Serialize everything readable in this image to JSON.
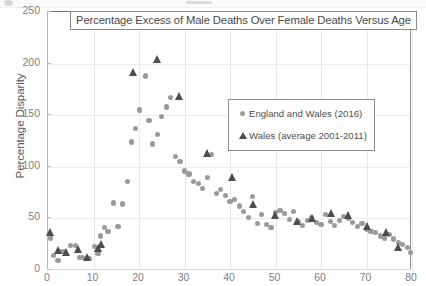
{
  "chart_data": {
    "type": "scatter",
    "title": "Percentage Excess of Male Deaths Over Female Deaths Versus Age",
    "xlabel": "Age",
    "ylabel": "Percentage Disparity",
    "xlim": [
      0,
      80
    ],
    "ylim": [
      0,
      250
    ],
    "xticks": [
      0,
      10,
      20,
      30,
      40,
      50,
      60,
      70,
      80
    ],
    "yticks": [
      0,
      50,
      100,
      150,
      200,
      250
    ],
    "grid": true,
    "legend_position": "center-right",
    "series": [
      {
        "name": "England and Wales (2016)",
        "marker": "circle",
        "color": "#9a9a9a",
        "points": [
          [
            0.5,
            31
          ],
          [
            1.2,
            14
          ],
          [
            2.2,
            9
          ],
          [
            3.0,
            18
          ],
          [
            3.6,
            18
          ],
          [
            5.0,
            24
          ],
          [
            6.0,
            24
          ],
          [
            7.0,
            12
          ],
          [
            7.6,
            12
          ],
          [
            9.0,
            11
          ],
          [
            10.2,
            23
          ],
          [
            11.0,
            16
          ],
          [
            11.6,
            33
          ],
          [
            12.4,
            41
          ],
          [
            13.2,
            37
          ],
          [
            14.4,
            65
          ],
          [
            15.4,
            42
          ],
          [
            16.4,
            64
          ],
          [
            17.4,
            86
          ],
          [
            18.4,
            124
          ],
          [
            19.2,
            137
          ],
          [
            20.2,
            155
          ],
          [
            21.4,
            188
          ],
          [
            22.2,
            145
          ],
          [
            23.0,
            122
          ],
          [
            24.0,
            131
          ],
          [
            25.0,
            149
          ],
          [
            26.0,
            158
          ],
          [
            27.0,
            167
          ],
          [
            28.0,
            110
          ],
          [
            29.0,
            105
          ],
          [
            30.0,
            96
          ],
          [
            31.0,
            93
          ],
          [
            32.0,
            86
          ],
          [
            33.0,
            84
          ],
          [
            34.0,
            79
          ],
          [
            35.0,
            90
          ],
          [
            36.0,
            112
          ],
          [
            37.0,
            74
          ],
          [
            38.0,
            78
          ],
          [
            39.0,
            72
          ],
          [
            40.0,
            66
          ],
          [
            41.0,
            68
          ],
          [
            42.0,
            62
          ],
          [
            43.0,
            57
          ],
          [
            44.0,
            51
          ],
          [
            45.0,
            71
          ],
          [
            46.0,
            45
          ],
          [
            47.0,
            54
          ],
          [
            48.0,
            44
          ],
          [
            49.0,
            41
          ],
          [
            50.0,
            56
          ],
          [
            51.0,
            58
          ],
          [
            52.0,
            55
          ],
          [
            53.0,
            49
          ],
          [
            54.0,
            57
          ],
          [
            55.0,
            47
          ],
          [
            56.0,
            43
          ],
          [
            57.0,
            48
          ],
          [
            58.0,
            51
          ],
          [
            59.0,
            46
          ],
          [
            60.0,
            44
          ],
          [
            61.0,
            54
          ],
          [
            62.0,
            47
          ],
          [
            63.0,
            43
          ],
          [
            64.0,
            48
          ],
          [
            65.0,
            52
          ],
          [
            66.0,
            50
          ],
          [
            67.0,
            46
          ],
          [
            68.0,
            42
          ],
          [
            69.0,
            45
          ],
          [
            70.0,
            39
          ],
          [
            71.0,
            37
          ],
          [
            72.0,
            36
          ],
          [
            73.0,
            33
          ],
          [
            74.0,
            31
          ],
          [
            75.0,
            34
          ],
          [
            76.0,
            30
          ],
          [
            77.0,
            27
          ],
          [
            78.0,
            25
          ],
          [
            79.0,
            22
          ],
          [
            79.6,
            17
          ]
        ]
      },
      {
        "name": "Wales (average 2001-2011)",
        "marker": "triangle",
        "color": "#4d4d4d",
        "points": [
          [
            0.6,
            37
          ],
          [
            2.2,
            19
          ],
          [
            4.0,
            17
          ],
          [
            6.8,
            20
          ],
          [
            8.6,
            13
          ],
          [
            11.2,
            21
          ],
          [
            11.8,
            25
          ],
          [
            18.8,
            192
          ],
          [
            24.0,
            204
          ],
          [
            29.0,
            169
          ],
          [
            35.0,
            113
          ],
          [
            40.6,
            90
          ],
          [
            45.2,
            64
          ],
          [
            50.0,
            53
          ],
          [
            54.8,
            47
          ],
          [
            58.2,
            50
          ],
          [
            62.4,
            55
          ],
          [
            66.0,
            53
          ],
          [
            70.2,
            43
          ],
          [
            74.4,
            37
          ],
          [
            77.0,
            22
          ]
        ]
      }
    ]
  }
}
